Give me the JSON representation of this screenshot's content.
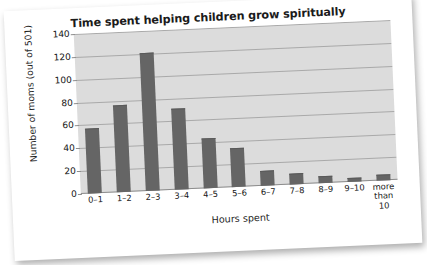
{
  "chart_data": {
    "type": "bar",
    "title": "Time spent helping children grow spiritually",
    "xlabel": "Hours spent",
    "ylabel": "Number of moms (out of 501)",
    "categories": [
      "0–1",
      "1–2",
      "2–3",
      "3–4",
      "4–5",
      "5–6",
      "6–7",
      "7–8",
      "8–9",
      "9–10",
      "more than 10"
    ],
    "values": [
      56,
      75,
      120,
      70,
      43,
      33,
      12,
      9,
      5,
      3,
      4
    ],
    "ylim": [
      0,
      140
    ],
    "yticks": [
      0,
      20,
      40,
      60,
      80,
      100,
      120,
      140
    ],
    "ytick_labels": [
      "0",
      "20",
      "40",
      "60",
      "80",
      "100",
      "120",
      "140"
    ],
    "grid": true,
    "legend": false,
    "bar_color": "#656565",
    "plot_background": "#dcdcdc",
    "gridline_color": "#a9a9a9"
  },
  "xtick_lines": [
    [
      "0–1"
    ],
    [
      "1–2"
    ],
    [
      "2–3"
    ],
    [
      "3–4"
    ],
    [
      "4–5"
    ],
    [
      "5–6"
    ],
    [
      "6–7"
    ],
    [
      "7–8"
    ],
    [
      "8–9"
    ],
    [
      "9–10"
    ],
    [
      "more",
      "than 10"
    ]
  ]
}
